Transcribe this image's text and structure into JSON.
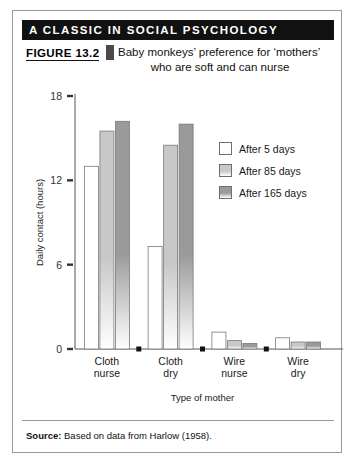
{
  "banner": {
    "text": "A CLASSIC IN SOCIAL PSYCHOLOGY"
  },
  "caption": {
    "figure_number": "FIGURE 13.2",
    "line1": "Baby monkeys’ preference for ‘mothers’",
    "line2": "who are soft and can nurse"
  },
  "legend": {
    "items": [
      {
        "label": "After 5 days",
        "color": "#fcfcfc"
      },
      {
        "label": "After 85 days",
        "color": "#c8c8c8"
      },
      {
        "label": "After 165 days",
        "color": "#9a9a9a"
      }
    ]
  },
  "source": {
    "prefix": "Source:",
    "text": " Based on data from Harlow (1958)."
  },
  "chart_data": {
    "type": "bar",
    "title": "Baby monkeys’ preference for ‘mothers’ who are soft and can nurse",
    "xlabel": "Type of mother",
    "ylabel": "Daily contact (hours)",
    "categories": [
      "Cloth nurse",
      "Cloth dry",
      "Wire nurse",
      "Wire dry"
    ],
    "category_lines": [
      [
        "Cloth",
        "nurse"
      ],
      [
        "Cloth",
        "dry"
      ],
      [
        "Wire",
        "nurse"
      ],
      [
        "Wire",
        "dry"
      ]
    ],
    "series": [
      {
        "name": "After 5 days",
        "color": "#fcfcfc",
        "values": [
          13.0,
          7.3,
          1.2,
          0.8
        ]
      },
      {
        "name": "After 85 days",
        "color": "#c8c8c8",
        "values": [
          15.5,
          14.5,
          0.6,
          0.5
        ]
      },
      {
        "name": "After 165 days",
        "color": "#9a9a9a",
        "values": [
          16.2,
          16.0,
          0.4,
          0.5
        ]
      }
    ],
    "yticks": [
      0,
      6,
      12,
      18
    ],
    "ylim": [
      0,
      18
    ],
    "grid": false,
    "legend_position": "upper right"
  }
}
